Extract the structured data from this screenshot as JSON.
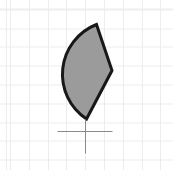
{
  "canvas": {
    "background_color": "#ffffff",
    "grid_color": "#ededed",
    "grid_spacing_px": 18.8,
    "grid_offset_x": 10,
    "grid_offset_y": 9.5,
    "width_px": 173,
    "height_px": 170
  },
  "shape": {
    "kind": "pie-sector",
    "fill_color": "#9b9b9b",
    "stroke_color": "#181818",
    "stroke_width": 3,
    "path": "M 96.5 24.5 L 112 70.5 L 86.5 119 A 53.5 53.5 0 0 1 96.5 24.5 Z",
    "apex_top": [
      96.5,
      24.5
    ],
    "corner_right": [
      112,
      70.5
    ],
    "apex_bottom": [
      86.5,
      119
    ],
    "arc_radius": 53.5
  },
  "crosshair": {
    "color": "#8a8a8a",
    "stroke_width": 1,
    "center": [
      85.5,
      131.5
    ],
    "h_line": {
      "x1": 57.5,
      "y1": 131.5,
      "x2": 112.5,
      "y2": 131.5
    },
    "v_line": {
      "x1": 85.5,
      "y1": 119.5,
      "x2": 85.5,
      "y2": 153.5
    }
  }
}
